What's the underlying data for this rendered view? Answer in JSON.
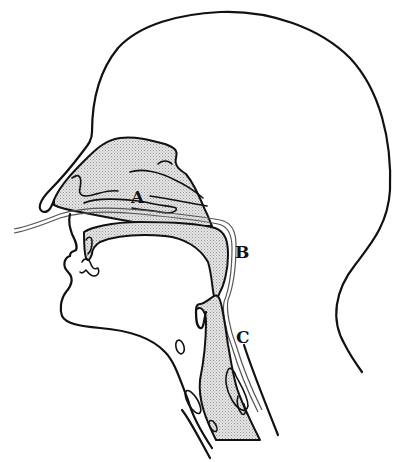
{
  "figure": {
    "labels": [
      {
        "id": "A",
        "text": "A"
      },
      {
        "id": "B",
        "text": "B"
      },
      {
        "id": "C",
        "text": "C"
      }
    ],
    "colors": {
      "line": "#111111",
      "shading": "#c8c8c8",
      "background": "#ffffff"
    }
  }
}
